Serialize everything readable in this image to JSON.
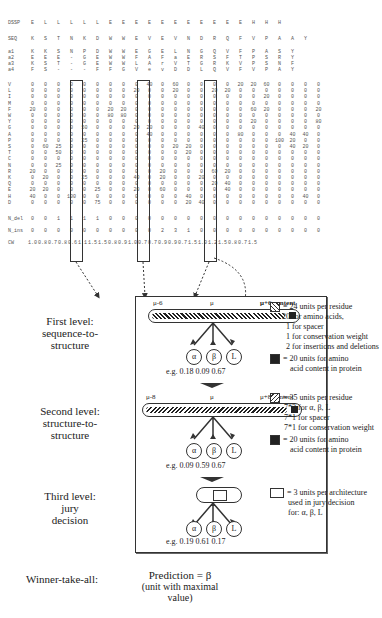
{
  "profile_table": {
    "rows": [
      {
        "label": "DSSP",
        "values": [
          "E",
          "L",
          "L",
          "L",
          "L",
          "L",
          "E",
          "E",
          "E",
          "E",
          "E",
          "E",
          "E",
          "E",
          "E",
          "E",
          "E",
          "H",
          "H",
          "H"
        ]
      },
      {
        "label": "SEQ",
        "values": [
          "K",
          "S",
          "T",
          "N",
          "K",
          "D",
          "W",
          "W",
          "E",
          "V",
          "E",
          "V",
          "N",
          "D",
          "R",
          "Q",
          "F",
          "V",
          "P",
          "A",
          "A",
          "Y"
        ]
      },
      {
        "label": "a1",
        "values": [
          "K",
          "K",
          "S",
          "N",
          "P",
          "D",
          "W",
          "W",
          "E",
          "G",
          "E",
          "L",
          "N",
          "G",
          "Q",
          "V",
          "F",
          "P",
          "A",
          "S",
          "Y"
        ]
      },
      {
        "label": "a2",
        "values": [
          "E",
          "E",
          "E",
          "-",
          "G",
          "E",
          "W",
          "W",
          "F",
          "A",
          "F",
          "a",
          "E",
          "R",
          "S",
          "F",
          "T",
          "P",
          "S",
          "R",
          "Y"
        ]
      },
      {
        "label": "a3",
        "values": [
          "K",
          "S",
          "T",
          "-",
          "G",
          "E",
          "W",
          "W",
          "L",
          "A",
          "r",
          "V",
          "T",
          "G",
          "R",
          "K",
          "V",
          "P",
          "S",
          "N",
          "F"
        ]
      },
      {
        "label": "a4",
        "values": [
          "F",
          "S",
          "-",
          "-",
          "-",
          "F",
          "F",
          "G",
          "V",
          "e",
          "v",
          "D",
          "D",
          "L",
          "Q",
          "V",
          "F",
          "V",
          "P",
          "A",
          "Y"
        ]
      },
      {
        "label": "V",
        "values": [
          "0",
          "0",
          "0",
          "0",
          "0",
          "0",
          "0",
          "0",
          "0",
          "40",
          "0",
          "60",
          "0",
          "0",
          "0",
          "0",
          "20",
          "20",
          "60",
          "0",
          "0",
          "0",
          "0"
        ]
      },
      {
        "label": "L",
        "values": [
          "0",
          "0",
          "0",
          "0",
          "0",
          "0",
          "0",
          "0",
          "20",
          "0",
          "0",
          "20",
          "0",
          "0",
          "20",
          "20",
          "0",
          "0",
          "0",
          "0",
          "0",
          "0",
          "0"
        ]
      },
      {
        "label": "I",
        "values": [
          "0",
          "0",
          "0",
          "0",
          "0",
          "0",
          "0",
          "0",
          "0",
          "0",
          "0",
          "0",
          "0",
          "0",
          "0",
          "0",
          "0",
          "0",
          "20",
          "0",
          "0",
          "0",
          "0"
        ]
      },
      {
        "label": "M",
        "values": [
          "0",
          "0",
          "0",
          "0",
          "0",
          "0",
          "0",
          "0",
          "0",
          "0",
          "0",
          "0",
          "0",
          "0",
          "0",
          "0",
          "0",
          "0",
          "0",
          "0",
          "0",
          "0",
          "0"
        ]
      },
      {
        "label": "F",
        "values": [
          "20",
          "0",
          "0",
          "0",
          "0",
          "0",
          "20",
          "20",
          "0",
          "0",
          "0",
          "0",
          "0",
          "0",
          "0",
          "0",
          "0",
          "60",
          "20",
          "0",
          "0",
          "0",
          "20"
        ]
      },
      {
        "label": "W",
        "values": [
          "0",
          "0",
          "0",
          "0",
          "0",
          "0",
          "80",
          "80",
          "0",
          "0",
          "0",
          "0",
          "0",
          "0",
          "0",
          "0",
          "0",
          "0",
          "0",
          "0",
          "0",
          "0",
          "0"
        ]
      },
      {
        "label": "Y",
        "values": [
          "0",
          "0",
          "0",
          "0",
          "0",
          "0",
          "0",
          "0",
          "0",
          "0",
          "0",
          "0",
          "0",
          "0",
          "0",
          "0",
          "0",
          "20",
          "0",
          "0",
          "0",
          "0",
          "80"
        ]
      },
      {
        "label": "G",
        "values": [
          "0",
          "0",
          "0",
          "0",
          "50",
          "0",
          "0",
          "0",
          "20",
          "20",
          "0",
          "0",
          "0",
          "40",
          "0",
          "0",
          "0",
          "0",
          "0",
          "0",
          "0",
          "0",
          "0"
        ]
      },
      {
        "label": "A",
        "values": [
          "0",
          "0",
          "0",
          "0",
          "0",
          "0",
          "0",
          "0",
          "0",
          "40",
          "0",
          "0",
          "0",
          "0",
          "0",
          "0",
          "80",
          "0",
          "0",
          "0",
          "40",
          "40",
          "0"
        ]
      },
      {
        "label": "P",
        "values": [
          "0",
          "0",
          "0",
          "0",
          "25",
          "0",
          "0",
          "0",
          "0",
          "0",
          "0",
          "0",
          "0",
          "0",
          "0",
          "0",
          "0",
          "0",
          "0",
          "100",
          "20",
          "0",
          "0"
        ]
      },
      {
        "label": "S",
        "values": [
          "0",
          "60",
          "25",
          "0",
          "0",
          "0",
          "0",
          "0",
          "0",
          "0",
          "0",
          "20",
          "20",
          "0",
          "0",
          "0",
          "0",
          "0",
          "0",
          "0",
          "40",
          "20",
          "0"
        ]
      },
      {
        "label": "T",
        "values": [
          "0",
          "0",
          "50",
          "0",
          "0",
          "0",
          "0",
          "0",
          "0",
          "0",
          "0",
          "0",
          "20",
          "0",
          "0",
          "0",
          "0",
          "0",
          "0",
          "0",
          "0",
          "0",
          "0"
        ]
      },
      {
        "label": "C",
        "values": [
          "0",
          "0",
          "0",
          "0",
          "0",
          "0",
          "0",
          "0",
          "0",
          "0",
          "0",
          "0",
          "0",
          "0",
          "0",
          "0",
          "0",
          "0",
          "0",
          "0",
          "0",
          "0",
          "0"
        ]
      },
      {
        "label": "N",
        "values": [
          "0",
          "0",
          "25",
          "0",
          "0",
          "0",
          "0",
          "0",
          "0",
          "0",
          "0",
          "0",
          "0",
          "0",
          "0",
          "0",
          "0",
          "0",
          "0",
          "0",
          "0",
          "0",
          "0"
        ]
      },
      {
        "label": "R",
        "values": [
          "20",
          "0",
          "0",
          "0",
          "0",
          "0",
          "0",
          "0",
          "0",
          "0",
          "20",
          "0",
          "0",
          "0",
          "60",
          "20",
          "0",
          "0",
          "0",
          "0",
          "0",
          "0",
          "0"
        ]
      },
      {
        "label": "K",
        "values": [
          "0",
          "20",
          "0",
          "0",
          "25",
          "0",
          "0",
          "0",
          "40",
          "0",
          "20",
          "0",
          "0",
          "20",
          "0",
          "0",
          "0",
          "0",
          "0",
          "0",
          "0",
          "0",
          "0"
        ]
      },
      {
        "label": "Q",
        "values": [
          "0",
          "0",
          "0",
          "0",
          "0",
          "0",
          "0",
          "0",
          "0",
          "0",
          "0",
          "0",
          "0",
          "0",
          "20",
          "40",
          "0",
          "0",
          "0",
          "0",
          "0",
          "0",
          "0"
        ]
      },
      {
        "label": "E",
        "values": [
          "20",
          "20",
          "0",
          "0",
          "0",
          "25",
          "0",
          "0",
          "20",
          "0",
          "60",
          "0",
          "0",
          "0",
          "0",
          "40",
          "0",
          "0",
          "0",
          "0",
          "0",
          "0",
          "0"
        ]
      },
      {
        "label": "H",
        "values": [
          "40",
          "0",
          "0",
          "100",
          "0",
          "0",
          "0",
          "0",
          "0",
          "0",
          "0",
          "0",
          "40",
          "0",
          "0",
          "0",
          "0",
          "0",
          "0",
          "0",
          "0",
          "40",
          "0"
        ]
      },
      {
        "label": "D",
        "values": [
          "0",
          "0",
          "0",
          "0",
          "0",
          "75",
          "0",
          "0",
          "0",
          "0",
          "0",
          "0",
          "20",
          "40",
          "0",
          "0",
          "0",
          "0",
          "0",
          "0",
          "0",
          "0",
          "0"
        ]
      },
      {
        "label": "N_del",
        "values": [
          "0",
          "0",
          "1",
          "1",
          "1",
          "1",
          "0",
          "0",
          "0",
          "0",
          "0",
          "0",
          "0",
          "0",
          "0",
          "0",
          "0",
          "0",
          "0",
          "0",
          "0",
          "0",
          "0"
        ]
      },
      {
        "label": "N_ins",
        "values": [
          "0",
          "0",
          "0",
          "0",
          "0",
          "0",
          "0",
          "0",
          "0",
          "0",
          "2",
          "3",
          "1",
          "0",
          "0",
          "0",
          "0",
          "0",
          "0",
          "0",
          "0",
          "0",
          "0"
        ]
      },
      {
        "label": "CW",
        "values": [
          "1.0",
          "0.8",
          "0.7",
          "0.8",
          "0.6",
          "1.1",
          "1.5",
          "1.5",
          "0.8",
          "0.9",
          "1.0",
          "0.7",
          "0.7",
          "0.9",
          "0.9",
          "0.7",
          "1.5",
          "1.0",
          "1.2",
          "1.5",
          "0.8",
          "0.7",
          "1.5"
        ]
      }
    ],
    "highlighted_columns": [
      "mu-6",
      "mu",
      "mu+6"
    ]
  },
  "levels": {
    "first": {
      "label": "First level: sequence-to-structure",
      "window_left": "μ-6",
      "window_center": "μ",
      "window_right": "μ+6 content",
      "outputs": [
        "α",
        "β",
        "L"
      ],
      "example": "e.g.  0.18  0.09  0.67"
    },
    "second": {
      "label": "Second level: structure-to-structure",
      "window_left": "μ-8",
      "window_center": "μ",
      "window_right": "μ+8 content",
      "outputs": [
        "α",
        "β",
        "L"
      ],
      "example": "e.g.  0.09  0.59  0.67"
    },
    "third": {
      "label": "Third level: jury decision",
      "outputs": [
        "α",
        "β",
        "L"
      ],
      "example": "e.g.  0.19  0.61  0.17"
    }
  },
  "level_labels": {
    "first": [
      "First level:",
      "sequence-to-",
      "structure"
    ],
    "second": [
      "Second level:",
      "structure-to-",
      "structure"
    ],
    "third": [
      "Third level:",
      "jury",
      "decision"
    ]
  },
  "legend": {
    "first": {
      "hatch": [
        "= 24 units per residue",
        "20 for amino acids,",
        "1 for spacer",
        "1 for conservation weight",
        "2 for insertions and deletions"
      ],
      "solid": [
        "= 20 units for amino",
        "acid content in protein"
      ]
    },
    "second": {
      "hatch": [
        "= 35 units per residue",
        "7*3 for α, β, L",
        "7*1 for spacer",
        "7*1 for conservation weight"
      ],
      "solid": [
        "= 20 units for amino",
        "acid content in protein"
      ]
    },
    "third": {
      "jury": [
        "= 3 units per architecture",
        "used in jury decision",
        "for:  α, β, L"
      ]
    }
  },
  "winner": {
    "label": "Winner-take-all:",
    "prediction": "Prediction = β",
    "note": "(unit with maximal value)"
  }
}
